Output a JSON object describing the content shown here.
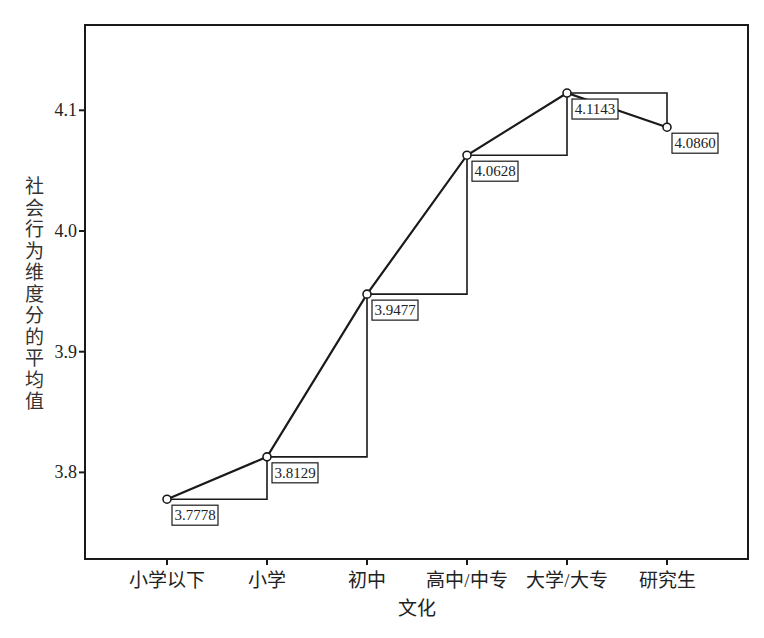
{
  "chart_data": {
    "type": "line",
    "title": "",
    "xlabel": "文化",
    "ylabel": "社会行为维度分的平均值",
    "categories": [
      "小学以下",
      "小学",
      "初中",
      "高中/中专",
      "大学/大专",
      "研究生"
    ],
    "series": [
      {
        "name": "社会行为维度分的平均值",
        "values": [
          3.7778,
          3.8129,
          3.9477,
          4.0628,
          4.1143,
          4.086
        ],
        "labels": [
          "3.7778",
          "3.8129",
          "3.9477",
          "4.0628",
          "4.1143",
          "4.0860"
        ]
      }
    ],
    "yticks": [
      "3.8",
      "3.9",
      "4.0",
      "4.1"
    ],
    "ytick_values": [
      3.8,
      3.9,
      4.0,
      4.1
    ],
    "ylim": [
      3.728,
      4.2
    ],
    "grid": false,
    "legend": "none",
    "step_lines": true,
    "colors": {
      "line": "#1a1a1a",
      "axis": "#1a1a1a",
      "text": "#222222"
    }
  }
}
